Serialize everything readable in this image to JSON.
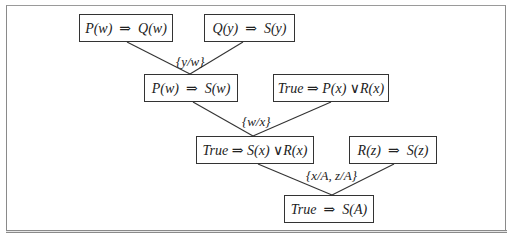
{
  "diagram": {
    "type": "resolution-proof-tree",
    "nodes": [
      {
        "id": "n1",
        "text": "P(w)  ⇒  Q(w)"
      },
      {
        "id": "n2",
        "text": "Q(y)  ⇒  S(y)"
      },
      {
        "id": "n3",
        "text": "P(w)  ⇒  S(w)"
      },
      {
        "id": "n4",
        "text": "True ⇒ P(x) ∨R(x)"
      },
      {
        "id": "n5",
        "text": "True ⇒ S(x) ∨R(x)"
      },
      {
        "id": "n6",
        "text": "R(z)  ⇒  S(z)"
      },
      {
        "id": "n7",
        "text": "True  ⇒  S(A)"
      }
    ],
    "substitutions": [
      {
        "id": "s1",
        "text": "{y/w}",
        "from": [
          "n1",
          "n2"
        ],
        "to": "n3"
      },
      {
        "id": "s2",
        "text": "{w/x}",
        "from": [
          "n3",
          "n4"
        ],
        "to": "n5"
      },
      {
        "id": "s3",
        "text": "{x/A, z/A}",
        "from": [
          "n5",
          "n6"
        ],
        "to": "n7"
      }
    ]
  },
  "colors": {
    "line": "#333333",
    "frame": "#8a8a8a",
    "background": "#ffffff"
  }
}
